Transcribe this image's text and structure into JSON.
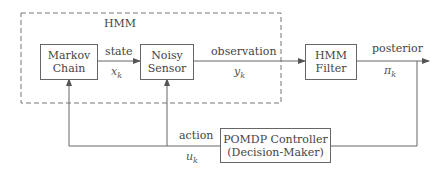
{
  "diagram": {
    "group": {
      "label": "HMM",
      "style": "dashed"
    },
    "blocks": {
      "markov_chain": {
        "line1": "Markov",
        "line2": "Chain"
      },
      "noisy_sensor": {
        "line1": "Noisy",
        "line2": "Sensor"
      },
      "hmm_filter": {
        "line1": "HMM",
        "line2": "Filter"
      },
      "pomdp_controller": {
        "line1": "POMDP Controller",
        "line2": "(Decision-Maker)"
      }
    },
    "edges": {
      "state": {
        "label": "state",
        "symbol": "x",
        "subscript": "k"
      },
      "observation": {
        "label": "observation",
        "symbol": "y",
        "subscript": "k"
      },
      "posterior": {
        "label": "posterior",
        "symbol": "π",
        "subscript": "k"
      },
      "action": {
        "label": "action",
        "symbol": "u",
        "subscript": "k"
      }
    },
    "colors": {
      "line": "#666666",
      "dashed": "#777777",
      "text": "#444444"
    }
  }
}
